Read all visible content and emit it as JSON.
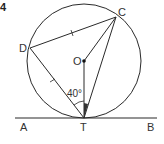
{
  "question_number": "4",
  "diagram": {
    "type": "circle-geometry",
    "points": {
      "A": {
        "label": "A"
      },
      "T": {
        "label": "T"
      },
      "B": {
        "label": "B"
      },
      "C": {
        "label": "C"
      },
      "D": {
        "label": "D"
      },
      "O": {
        "label": "O"
      }
    },
    "angle_label": "40°",
    "line_color": "#2a2a2a",
    "shade_color": "#333333"
  }
}
